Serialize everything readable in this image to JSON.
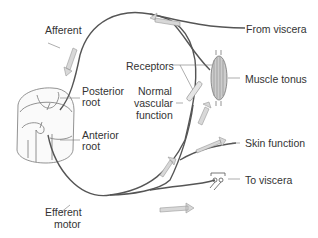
{
  "diagram": {
    "type": "reflex-arc-anatomy",
    "labels": {
      "afferent": "Afferent",
      "from_viscera": "From viscera",
      "posterior_root_1": "Posterior",
      "posterior_root_2": "root",
      "receptors": "Receptors",
      "muscle_tonus": "Muscle tonus",
      "normal_1": "Normal",
      "normal_2": "vascular",
      "normal_3": "function",
      "anterior_root_1": "Anterior",
      "anterior_root_2": "root",
      "skin_function": "Skin function",
      "to_viscera": "To viscera",
      "efferent_1": "Efferent",
      "efferent_2": "motor"
    },
    "colors": {
      "nerve": "#555555",
      "arrow_fill": "#d8d8d8",
      "arrow_stroke": "#999999",
      "text": "#333333"
    }
  }
}
